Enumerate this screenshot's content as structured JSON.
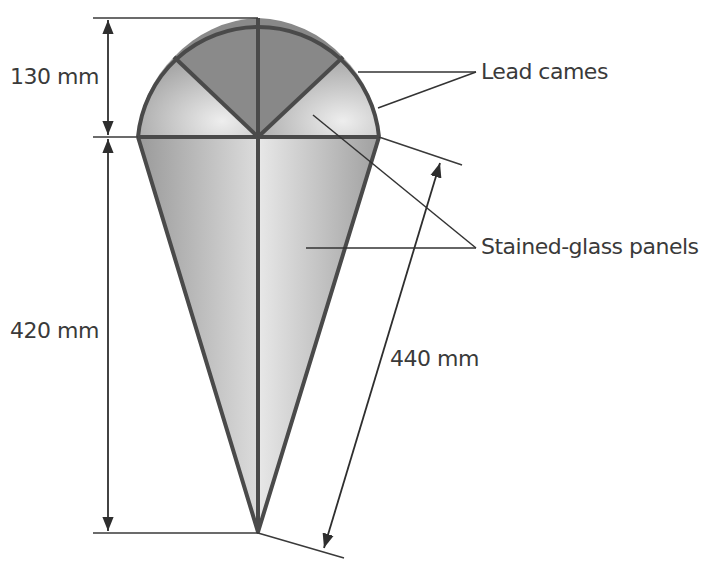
{
  "diagram": {
    "dimensions": {
      "dome_height": "130 mm",
      "cone_height": "420 mm",
      "slant_length": "440 mm"
    },
    "callouts": {
      "lead_cames": "Lead cames",
      "stained_glass_panels": "Stained-glass panels"
    },
    "colors": {
      "outline": "#4a4a4a",
      "glass_dark": "#7a7a7a",
      "glass_light": "#e6e6e6",
      "text": "#3a3a3a"
    }
  }
}
